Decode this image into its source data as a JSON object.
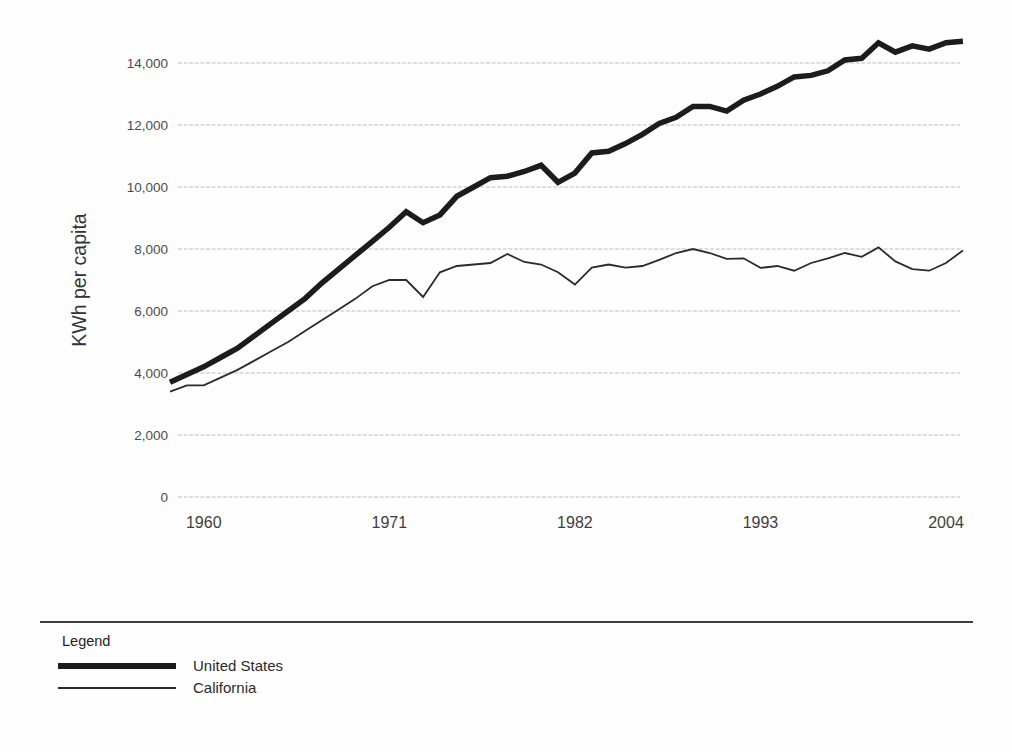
{
  "chart_data": {
    "type": "line",
    "title": "",
    "xlabel": "",
    "ylabel": "KWh per capita",
    "grid": "horizontal",
    "legend_position": "bottom",
    "ylim": [
      0,
      14800
    ],
    "y_ticks": [
      0,
      2000,
      4000,
      6000,
      8000,
      10000,
      12000,
      14000
    ],
    "y_tick_labels": [
      "0",
      "2,000",
      "4,000",
      "6,000",
      "8,000",
      "10,000",
      "12,000",
      "14,000"
    ],
    "x_ticks": [
      1960,
      1971,
      1982,
      1993,
      2004
    ],
    "x": [
      1958,
      1959,
      1960,
      1961,
      1962,
      1963,
      1964,
      1965,
      1966,
      1967,
      1968,
      1969,
      1970,
      1971,
      1972,
      1973,
      1974,
      1975,
      1976,
      1977,
      1978,
      1979,
      1980,
      1981,
      1982,
      1983,
      1984,
      1985,
      1986,
      1987,
      1988,
      1989,
      1990,
      1991,
      1992,
      1993,
      1994,
      1995,
      1996,
      1997,
      1998,
      1999,
      2000,
      2001,
      2002,
      2003,
      2004,
      2005
    ],
    "series": [
      {
        "name": "United States",
        "color": "#1c1c1c",
        "stroke_width": 5.5,
        "values": [
          3700,
          3950,
          4200,
          4500,
          4800,
          5200,
          5600,
          6000,
          6400,
          6900,
          7350,
          7800,
          8250,
          8700,
          9200,
          8850,
          9100,
          9700,
          10000,
          10300,
          10350,
          10500,
          10700,
          10150,
          10450,
          11100,
          11150,
          11400,
          11700,
          12050,
          12250,
          12600,
          12600,
          12450,
          12800,
          13000,
          13250,
          13550,
          13600,
          13750,
          14100,
          14150,
          14650,
          14350,
          14550,
          14450,
          14650,
          14700
        ]
      },
      {
        "name": "California",
        "color": "#2b2b2b",
        "stroke_width": 1.8,
        "values": [
          3400,
          3600,
          3600,
          3850,
          4100,
          4400,
          4700,
          5000,
          5350,
          5700,
          6050,
          6400,
          6800,
          7000,
          7000,
          6450,
          7250,
          7450,
          7500,
          7550,
          7840,
          7580,
          7500,
          7250,
          6850,
          7400,
          7500,
          7400,
          7450,
          7650,
          7870,
          8000,
          7870,
          7680,
          7700,
          7390,
          7450,
          7300,
          7550,
          7700,
          7870,
          7750,
          8050,
          7600,
          7350,
          7300,
          7550,
          7950
        ]
      }
    ]
  },
  "legend": {
    "title": "Legend",
    "items": [
      {
        "label": "United States"
      },
      {
        "label": "California"
      }
    ]
  }
}
